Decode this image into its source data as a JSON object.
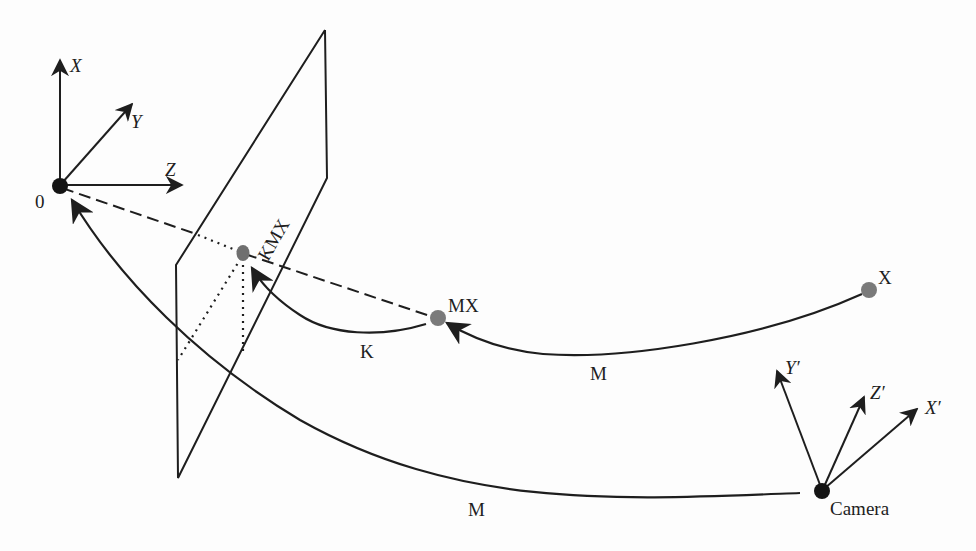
{
  "figure": {
    "type": "camera-projection-diagram",
    "world_frame": {
      "origin_label": "0",
      "axes": [
        {
          "name": "X",
          "label": "X"
        },
        {
          "name": "Y",
          "label": "Y"
        },
        {
          "name": "Z",
          "label": "Z"
        }
      ]
    },
    "camera_frame": {
      "origin_label": "Camera",
      "axes": [
        {
          "name": "Y'",
          "label": "Y′"
        },
        {
          "name": "Z'",
          "label": "Z′"
        },
        {
          "name": "X'",
          "label": "X′"
        }
      ]
    },
    "points": [
      {
        "id": "X",
        "label": "X"
      },
      {
        "id": "MX",
        "label": "MX"
      },
      {
        "id": "KMX",
        "label": "KMX"
      }
    ],
    "transforms": [
      {
        "from": "X",
        "to": "MX",
        "label": "M"
      },
      {
        "from": "MX",
        "to": "KMX",
        "label": "K"
      },
      {
        "from": "Camera",
        "to": "0",
        "label": "M"
      }
    ],
    "colors": {
      "ink": "#1e1e1e",
      "point_fill": "#777777",
      "background": "#fdfdfd"
    }
  }
}
